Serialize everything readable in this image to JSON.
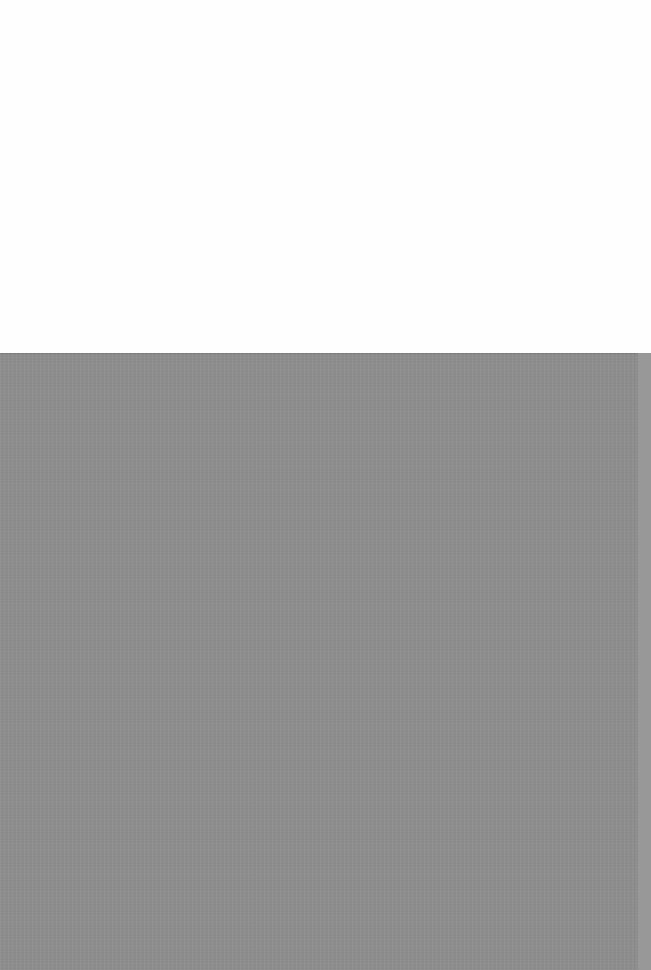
{
  "scene": {
    "description": "Blank white surface above a plain textured gray surface; no text or UI elements visible",
    "colors": {
      "top_background": "#fefefe",
      "bottom_background": "#8e8e8e",
      "right_edge_strip": "#989898"
    },
    "regions": {
      "top_height_px": 353,
      "bottom_height_px": 617
    }
  }
}
